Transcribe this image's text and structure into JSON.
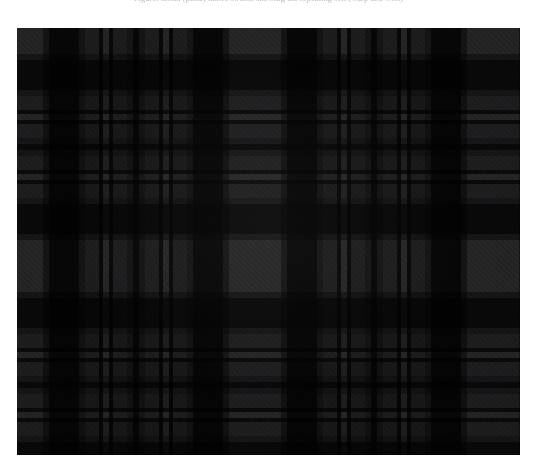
{
  "page": {
    "background_color": "#ffffff",
    "width": 537,
    "height": 476
  },
  "caption": {
    "text": "Figure: tartan (plaid) fabric swatch showing the repeating sett (warp and weft)",
    "color": "#b9b9bd",
    "note": "clipped at the top edge of the frame; only descenders are visible"
  },
  "swatch": {
    "name": "tartan-plaid-swatch",
    "alt": "Dark grey and black tartan plaid textile swatch",
    "x": 17,
    "y": 28,
    "width": 503,
    "height": 427,
    "weave": "2/2 twill",
    "twill_direction": "lower-left to upper-right",
    "sett_repeat_px": 122,
    "symmetry": "symmetric (mirrored) sett",
    "palette": {
      "light_grey": "#5f5f61",
      "mid_grey": "#4a4a4c",
      "dark_grey": "#303032",
      "charcoal": "#1e1e20",
      "black": "#0d0d0f",
      "accent_line": "#121214"
    },
    "warp_stripes": [
      {
        "color": "#5f5f61",
        "width": 26
      },
      {
        "color": "#343436",
        "width": 6
      },
      {
        "color": "#101012",
        "width": 30
      },
      {
        "color": "#343436",
        "width": 6
      },
      {
        "color": "#4a4a4c",
        "width": 14
      },
      {
        "color": "#121214",
        "width": 4
      },
      {
        "color": "#5f5f61",
        "width": 6
      },
      {
        "color": "#121214",
        "width": 4
      },
      {
        "color": "#4a4a4c",
        "width": 14
      },
      {
        "color": "#343436",
        "width": 6
      },
      {
        "color": "#101012",
        "width": 6
      }
    ],
    "weft_stripes": [
      {
        "color": "#5f5f61",
        "height": 26
      },
      {
        "color": "#343436",
        "height": 6
      },
      {
        "color": "#101012",
        "height": 30
      },
      {
        "color": "#343436",
        "height": 6
      },
      {
        "color": "#4a4a4c",
        "height": 14
      },
      {
        "color": "#121214",
        "height": 4
      },
      {
        "color": "#5f5f61",
        "height": 6
      },
      {
        "color": "#121214",
        "height": 4
      },
      {
        "color": "#4a4a4c",
        "height": 14
      },
      {
        "color": "#343436",
        "height": 6
      },
      {
        "color": "#101012",
        "height": 6
      }
    ]
  }
}
